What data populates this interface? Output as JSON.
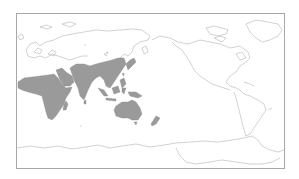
{
  "map": {
    "type": "world distribution map",
    "projection": "Pacific-centered equirectangular",
    "colors": {
      "background": "#ffffff",
      "frame": "#a8a8a8",
      "coastline": "#b4b4b4",
      "range_fill": "#9a9a9a"
    },
    "range": {
      "label": "Distribution range",
      "regions": [
        "Sub-Saharan Africa",
        "Arabian Peninsula",
        "Indian subcontinent",
        "Southern China",
        "Southeast Asia",
        "Japan",
        "Indonesia",
        "New Guinea",
        "Australia",
        "New Zealand"
      ]
    }
  }
}
